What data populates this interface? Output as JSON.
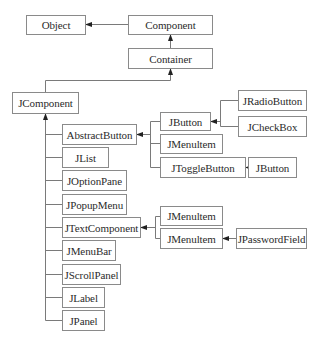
{
  "diagram": {
    "type": "class-hierarchy",
    "colors": {
      "background": "#ffffff",
      "box_border": "#8a8a8a",
      "line": "#7a7a7a",
      "arrow": "#222222",
      "text": "#2b2b2b"
    },
    "nodes": {
      "object": {
        "label": "Object"
      },
      "component": {
        "label": "Component"
      },
      "container": {
        "label": "Container"
      },
      "jcomponent": {
        "label": "JComponent"
      },
      "abstractbutton": {
        "label": "AbstractButton"
      },
      "jlist": {
        "label": "JList"
      },
      "joptionpane": {
        "label": "JOptionPane"
      },
      "jpopupmenu": {
        "label": "JPopupMenu"
      },
      "jtextcomponent": {
        "label": "JTextComponent"
      },
      "jmenubar": {
        "label": "JMenuBar"
      },
      "jscrollpanel": {
        "label": "JScrollPanel"
      },
      "jlabel": {
        "label": "JLabel"
      },
      "jpanel": {
        "label": "JPanel"
      },
      "jbutton_1": {
        "label": "JButton"
      },
      "jmenuitem_1": {
        "label": "JMenultem"
      },
      "jtogglebutton": {
        "label": "JToggleButton"
      },
      "jradiobutton": {
        "label": "JRadioButton"
      },
      "jcheckbox": {
        "label": "JCheckBox"
      },
      "jbutton_2": {
        "label": "JButton"
      },
      "jmenuitem_2": {
        "label": "JMenultem"
      },
      "jmenuitem_3": {
        "label": "JMenultem"
      },
      "jpasswordfield": {
        "label": "JPasswordField"
      }
    },
    "edges": [
      {
        "from": "Component",
        "to": "Object"
      },
      {
        "from": "Container",
        "to": "Component"
      },
      {
        "from": "JComponent",
        "to": "Container"
      },
      {
        "from": "AbstractButton",
        "to": "JComponent"
      },
      {
        "from": "JList",
        "to": "JComponent"
      },
      {
        "from": "JOptionPane",
        "to": "JComponent"
      },
      {
        "from": "JPopupMenu",
        "to": "JComponent"
      },
      {
        "from": "JTextComponent",
        "to": "JComponent"
      },
      {
        "from": "JMenuBar",
        "to": "JComponent"
      },
      {
        "from": "JScrollPanel",
        "to": "JComponent"
      },
      {
        "from": "JLabel",
        "to": "JComponent"
      },
      {
        "from": "JPanel",
        "to": "JComponent"
      },
      {
        "from": "JButton",
        "to": "AbstractButton"
      },
      {
        "from": "JMenultem",
        "to": "AbstractButton"
      },
      {
        "from": "JToggleButton",
        "to": "AbstractButton"
      },
      {
        "from": "JRadioButton",
        "to": "JButton"
      },
      {
        "from": "JCheckBox",
        "to": "JButton"
      },
      {
        "from": "JButton",
        "to": "JToggleButton"
      },
      {
        "from": "JMenultem",
        "to": "JTextComponent"
      },
      {
        "from": "JMenultem",
        "to": "JTextComponent"
      },
      {
        "from": "JPasswordField",
        "to": "JMenultem"
      }
    ]
  }
}
